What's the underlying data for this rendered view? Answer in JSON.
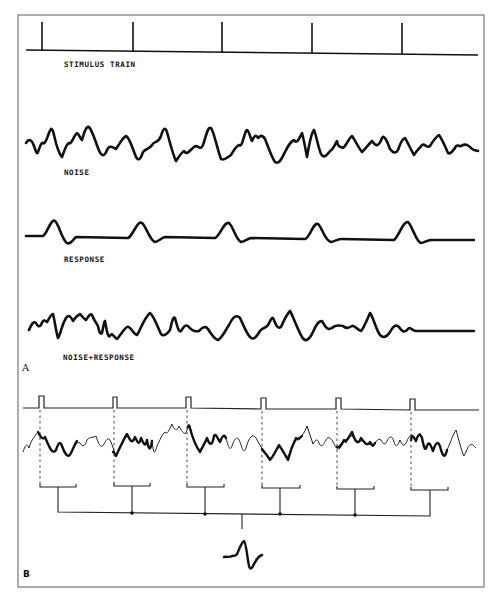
{
  "figure": {
    "panel_a": {
      "label": "A",
      "traces": [
        {
          "id": "stimulus",
          "label": "STIMULUS TRAIN"
        },
        {
          "id": "noise",
          "label": "NOISE"
        },
        {
          "id": "response",
          "label": "RESPONSE"
        },
        {
          "id": "noise_response",
          "label": "NOISE+RESPONSE"
        }
      ],
      "stimulus_positions_x": [
        42,
        133,
        222,
        312,
        402
      ]
    },
    "panel_b": {
      "label": "B",
      "stimulus_positions_x": [
        42,
        115,
        189,
        264,
        339,
        413
      ],
      "description": "Epochs following each stimulus (bold segments) are summed to yield the averaged evoked response"
    },
    "colors": {
      "ink": "#111111",
      "frame": "#8a8a8a",
      "background": "#ffffff"
    }
  }
}
